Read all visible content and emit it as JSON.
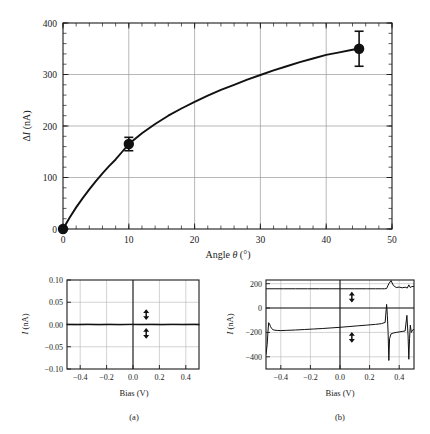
{
  "figure": {
    "background_color": "#ffffff",
    "ink_color": "#111111",
    "grid_color": "#9a9a9a"
  },
  "chart_data": [
    {
      "id": "main-angle-plot",
      "type": "line",
      "title": "",
      "xlabel": "Angle θ (°)",
      "ylabel": "ΔI (nA)",
      "ylabel_parts": {
        "delta": "Δ",
        "symbol": "I",
        "unit": " (nA)"
      },
      "xlabel_parts": {
        "word": "Angle ",
        "symbol": "θ",
        "unit": " (°)"
      },
      "xlim": [
        0,
        50
      ],
      "ylim": [
        0,
        400
      ],
      "xticks": [
        0,
        10,
        20,
        30,
        40,
        50
      ],
      "xtick_labels": [
        "0",
        "10",
        "20",
        "30",
        "40",
        "50"
      ],
      "yticks": [
        0,
        100,
        200,
        300,
        400
      ],
      "ytick_labels": [
        "0",
        "100",
        "200",
        "300",
        "400"
      ],
      "x_minor_step": 2,
      "y_minor_step": 20,
      "grid": true,
      "legend": "none",
      "points": [
        {
          "x": 0,
          "y": 0,
          "yerr": 0
        },
        {
          "x": 10,
          "y": 165,
          "yerr": 13
        },
        {
          "x": 45,
          "y": 350,
          "yerr": 34
        }
      ],
      "fit_curve": {
        "description": "monotonic saturating fit through data points",
        "x": [
          0,
          1,
          2,
          3,
          4,
          5,
          6,
          7,
          8,
          9,
          10,
          12,
          14,
          16,
          18,
          20,
          22,
          24,
          26,
          28,
          30,
          32,
          34,
          36,
          38,
          40,
          42,
          44,
          45
        ],
        "y": [
          0,
          22,
          42,
          60,
          77,
          93,
          108,
          122,
          135,
          150,
          165,
          186,
          204,
          220,
          234,
          247,
          259,
          270,
          280,
          290,
          299,
          308,
          316,
          324,
          331,
          338,
          343,
          348,
          350
        ]
      }
    },
    {
      "id": "panel-a-iv",
      "type": "line",
      "caption": "(a)",
      "xlabel": "Bias (V)",
      "ylabel": "I (nA)",
      "ylabel_parts": {
        "symbol": "I",
        "unit": " (nA)"
      },
      "xlim": [
        -0.5,
        0.5
      ],
      "ylim": [
        -0.1,
        0.1
      ],
      "xticks": [
        -0.4,
        -0.2,
        0.0,
        0.2,
        0.4
      ],
      "xtick_labels": [
        "−0.4",
        "−0.2",
        "0.0",
        "0.2",
        "0.4"
      ],
      "yticks": [
        -0.1,
        -0.05,
        0.0,
        0.05,
        0.1
      ],
      "ytick_labels": [
        "−0.10",
        "−0.05",
        "0.00",
        "0.05",
        "0.10"
      ],
      "grid": true,
      "zero_axis_v": 0.0,
      "zero_axis_h": 0.0,
      "sweep_arrows": [
        {
          "x": 0.1,
          "y": 0.022,
          "name": "sweep-arrow-upper"
        },
        {
          "x": 0.1,
          "y": -0.02,
          "name": "sweep-arrow-lower"
        }
      ],
      "series": [
        {
          "name": "forward-sweep",
          "x": [
            -0.5,
            -0.42,
            -0.34,
            -0.26,
            -0.18,
            -0.1,
            -0.02,
            0.06,
            0.14,
            0.22,
            0.3,
            0.38,
            0.46,
            0.5
          ],
          "y": [
            0.0008,
            0.0006,
            0.0009,
            0.0005,
            0.0008,
            0.0004,
            0.0007,
            0.0006,
            0.0009,
            0.0005,
            0.0008,
            0.0006,
            0.0009,
            0.0007
          ]
        },
        {
          "name": "reverse-sweep",
          "x": [
            -0.5,
            -0.42,
            -0.34,
            -0.26,
            -0.18,
            -0.1,
            -0.02,
            0.06,
            0.14,
            0.22,
            0.3,
            0.38,
            0.46,
            0.5
          ],
          "y": [
            -0.0006,
            -0.0008,
            -0.0004,
            -0.0009,
            -0.0005,
            -0.0008,
            -0.0003,
            -0.0007,
            -0.0005,
            -0.0008,
            -0.0004,
            -0.0007,
            -0.0005,
            -0.0008
          ]
        }
      ]
    },
    {
      "id": "panel-b-iv",
      "type": "line",
      "caption": "(b)",
      "xlabel": "Bias (V)",
      "ylabel": "I (nA)",
      "ylabel_parts": {
        "symbol": "I",
        "unit": " (nA)"
      },
      "xlim": [
        -0.5,
        0.5
      ],
      "ylim": [
        -500,
        230
      ],
      "xticks": [
        -0.4,
        -0.2,
        0.0,
        0.2,
        0.4
      ],
      "xtick_labels": [
        "−0.4",
        "−0.2",
        "0.0",
        "0.2",
        "0.4"
      ],
      "yticks": [
        -400,
        -200,
        0,
        200
      ],
      "ytick_labels": [
        "−400",
        "−200",
        "0",
        "200"
      ],
      "grid": true,
      "zero_axis_v": 0.0,
      "zero_axis_h": 0.0,
      "sweep_arrows": [
        {
          "x": 0.08,
          "y": 90,
          "name": "sweep-arrow-upper"
        },
        {
          "x": 0.08,
          "y": -240,
          "name": "sweep-arrow-lower"
        }
      ],
      "series": [
        {
          "name": "upper-branch",
          "x": [
            -0.5,
            -0.44,
            -0.38,
            -0.3,
            -0.22,
            -0.14,
            -0.06,
            0.02,
            0.1,
            0.18,
            0.24,
            0.28,
            0.3,
            0.315,
            0.33,
            0.345,
            0.36,
            0.38,
            0.4,
            0.42,
            0.44,
            0.455,
            0.465,
            0.475,
            0.485,
            0.5
          ],
          "y": [
            158,
            158,
            158,
            158,
            158,
            158,
            158,
            158,
            158,
            158,
            158,
            158,
            158,
            160,
            200,
            225,
            186,
            168,
            172,
            166,
            171,
            164,
            190,
            168,
            176,
            178
          ]
        },
        {
          "name": "lower-branch",
          "x": [
            -0.5,
            -0.492,
            -0.487,
            -0.482,
            -0.476,
            -0.47,
            -0.462,
            -0.452,
            -0.44,
            -0.42,
            -0.4,
            -0.36,
            -0.3,
            -0.24,
            -0.18,
            -0.12,
            -0.06,
            0.0,
            0.06,
            0.12,
            0.18,
            0.24,
            0.28,
            0.305,
            0.315,
            0.32,
            0.325,
            0.33,
            0.335,
            0.345,
            0.36,
            0.38,
            0.4,
            0.42,
            0.44,
            0.452,
            0.46,
            0.465,
            0.47,
            0.475,
            0.482,
            0.49,
            0.5
          ],
          "y": [
            -380,
            -300,
            -200,
            -120,
            -132,
            -150,
            -168,
            -178,
            -182,
            -184,
            -185,
            -183,
            -180,
            -176,
            -172,
            -168,
            -163,
            -158,
            -152,
            -146,
            -140,
            -134,
            -128,
            -118,
            30,
            -60,
            -200,
            -430,
            -250,
            -212,
            -205,
            -200,
            -196,
            -192,
            -188,
            -60,
            -230,
            -420,
            -250,
            -140,
            -200,
            -180,
            -175
          ]
        }
      ]
    }
  ]
}
